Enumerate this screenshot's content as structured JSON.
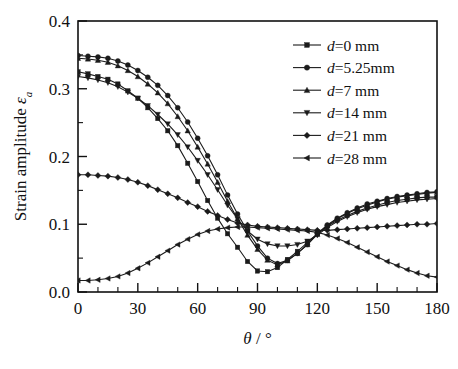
{
  "chart_data": {
    "type": "line",
    "title": "",
    "xlabel": "θ / °",
    "ylabel": "Strain amplitude εa",
    "xlim": [
      0,
      180
    ],
    "ylim": [
      0.0,
      0.4
    ],
    "xticks": [
      0,
      30,
      60,
      90,
      120,
      150,
      180
    ],
    "xticklabels": [
      "0",
      "30",
      "60",
      "90",
      "120",
      "150",
      "180"
    ],
    "yticks": [
      0.0,
      0.1,
      0.2,
      0.3,
      0.4
    ],
    "yticklabels": [
      "0.0",
      "0.1",
      "0.2",
      "0.3",
      "0.4"
    ],
    "grid": false,
    "legend_position": "upper right",
    "x": [
      0,
      5,
      10,
      15,
      20,
      25,
      30,
      35,
      40,
      45,
      50,
      55,
      60,
      65,
      70,
      75,
      80,
      85,
      90,
      95,
      100,
      105,
      110,
      115,
      120,
      125,
      130,
      135,
      140,
      145,
      150,
      155,
      160,
      165,
      170,
      175,
      180
    ],
    "series": [
      {
        "name": "d=0 mm",
        "marker": "square",
        "values": [
          0.325,
          0.322,
          0.318,
          0.314,
          0.307,
          0.297,
          0.286,
          0.272,
          0.256,
          0.238,
          0.216,
          0.19,
          0.163,
          0.135,
          0.109,
          0.086,
          0.066,
          0.045,
          0.031,
          0.03,
          0.036,
          0.048,
          0.06,
          0.073,
          0.086,
          0.097,
          0.106,
          0.113,
          0.119,
          0.124,
          0.128,
          0.132,
          0.135,
          0.137,
          0.139,
          0.14,
          0.14
        ]
      },
      {
        "name": "d=5.25mm",
        "marker": "circle",
        "values": [
          0.349,
          0.348,
          0.347,
          0.345,
          0.341,
          0.335,
          0.327,
          0.317,
          0.305,
          0.29,
          0.272,
          0.251,
          0.227,
          0.201,
          0.173,
          0.143,
          0.115,
          0.09,
          0.068,
          0.05,
          0.042,
          0.047,
          0.057,
          0.07,
          0.086,
          0.099,
          0.109,
          0.117,
          0.124,
          0.13,
          0.134,
          0.138,
          0.141,
          0.143,
          0.145,
          0.147,
          0.148
        ]
      },
      {
        "name": "d=7 mm",
        "marker": "triangle-up",
        "values": [
          0.345,
          0.344,
          0.342,
          0.339,
          0.334,
          0.327,
          0.318,
          0.307,
          0.294,
          0.278,
          0.259,
          0.238,
          0.214,
          0.189,
          0.162,
          0.134,
          0.108,
          0.084,
          0.063,
          0.047,
          0.04,
          0.046,
          0.057,
          0.07,
          0.085,
          0.098,
          0.108,
          0.116,
          0.123,
          0.128,
          0.133,
          0.137,
          0.14,
          0.142,
          0.144,
          0.146,
          0.147
        ]
      },
      {
        "name": "d=14 mm",
        "marker": "triangle-down",
        "values": [
          0.318,
          0.316,
          0.313,
          0.309,
          0.303,
          0.295,
          0.286,
          0.275,
          0.262,
          0.248,
          0.232,
          0.214,
          0.194,
          0.173,
          0.151,
          0.128,
          0.108,
          0.09,
          0.078,
          0.071,
          0.068,
          0.068,
          0.07,
          0.075,
          0.084,
          0.095,
          0.104,
          0.111,
          0.117,
          0.122,
          0.126,
          0.129,
          0.132,
          0.134,
          0.136,
          0.137,
          0.138
        ]
      },
      {
        "name": "d=21 mm",
        "marker": "diamond",
        "values": [
          0.173,
          0.173,
          0.172,
          0.171,
          0.169,
          0.166,
          0.162,
          0.157,
          0.151,
          0.145,
          0.139,
          0.132,
          0.126,
          0.119,
          0.113,
          0.107,
          0.102,
          0.099,
          0.097,
          0.096,
          0.095,
          0.094,
          0.093,
          0.092,
          0.091,
          0.091,
          0.092,
          0.093,
          0.094,
          0.095,
          0.096,
          0.097,
          0.098,
          0.099,
          0.1,
          0.1,
          0.101
        ]
      },
      {
        "name": "d=28 mm",
        "marker": "triangle-left",
        "values": [
          0.017,
          0.017,
          0.018,
          0.02,
          0.023,
          0.028,
          0.035,
          0.043,
          0.052,
          0.061,
          0.07,
          0.078,
          0.085,
          0.09,
          0.093,
          0.095,
          0.096,
          0.096,
          0.095,
          0.094,
          0.093,
          0.092,
          0.091,
          0.09,
          0.088,
          0.084,
          0.079,
          0.073,
          0.066,
          0.059,
          0.052,
          0.045,
          0.039,
          0.033,
          0.028,
          0.024,
          0.022
        ]
      }
    ]
  },
  "legend": {
    "items": [
      {
        "label": "d=0 mm",
        "marker": "square"
      },
      {
        "label": "d=5.25mm",
        "marker": "circle"
      },
      {
        "label": "d=7 mm",
        "marker": "triangle-up"
      },
      {
        "label": "d=14 mm",
        "marker": "triangle-down"
      },
      {
        "label": "d=21 mm",
        "marker": "diamond"
      },
      {
        "label": "d=28 mm",
        "marker": "triangle-left"
      }
    ]
  },
  "axes": {
    "y_title_main": "Strain amplitude",
    "y_title_symbol": "ε",
    "y_title_sub": "a",
    "x_title_symbol": "θ",
    "x_title_rest": "/ °"
  },
  "colors": {
    "ink": "#1b1b1b",
    "background": "#ffffff"
  }
}
